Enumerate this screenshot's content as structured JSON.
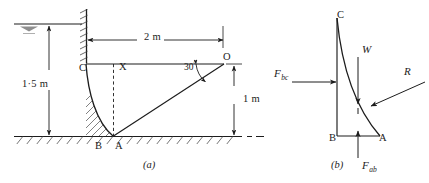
{
  "figure": {
    "panel_a": {
      "caption": "(a)",
      "points": [
        {
          "id": "C",
          "label": "C",
          "x": 79,
          "y": 63
        },
        {
          "id": "X",
          "label": "X",
          "x": 119,
          "y": 62
        },
        {
          "id": "O",
          "label": "O",
          "x": 223,
          "y": 52
        },
        {
          "id": "B",
          "label": "B",
          "x": 95,
          "y": 141
        },
        {
          "id": "A",
          "label": "A",
          "x": 115,
          "y": 141
        }
      ],
      "dimensions": [
        {
          "name": "vertical-depth",
          "value": "1·5 m",
          "x": 22,
          "y": 79
        },
        {
          "name": "horizontal-span",
          "value": "2 m",
          "x": 144,
          "y": 32
        },
        {
          "name": "vertical-height",
          "value": "1 m",
          "x": 243,
          "y": 94
        }
      ],
      "angle": {
        "name": "slope-angle",
        "value": "30",
        "unit": "°",
        "x": 184,
        "y": 61
      },
      "annotations": {
        "water_surface": "free-water-surface-symbol",
        "wall": "hatched-vertical-wall",
        "ground": "hatched-ground-line",
        "curve": "hatched-curved-dam-face",
        "dashed": "dashed-vertical-from-X-to-A"
      }
    },
    "panel_b": {
      "caption": "(b)",
      "points": [
        {
          "id": "C",
          "label": "C",
          "x": 337,
          "y": 10
        },
        {
          "id": "B",
          "label": "B",
          "x": 329,
          "y": 133
        },
        {
          "id": "A",
          "label": "A",
          "x": 379,
          "y": 133
        }
      ],
      "forces": [
        {
          "name": "F-bc",
          "symbol": "F",
          "sub": "bc",
          "x": 283,
          "y": 70
        },
        {
          "name": "W",
          "symbol": "W",
          "sub": "",
          "x": 358,
          "y": 55
        },
        {
          "name": "R",
          "symbol": "R",
          "sub": "",
          "x": 408,
          "y": 76
        },
        {
          "name": "F-ab",
          "symbol": "F",
          "sub": "ab",
          "x": 368,
          "y": 163
        }
      ]
    }
  },
  "colors": {
    "ink": "#1c1c1c",
    "line": "#2a2a2a",
    "hatch": "#3a3a3a",
    "background": "#ffffff"
  }
}
